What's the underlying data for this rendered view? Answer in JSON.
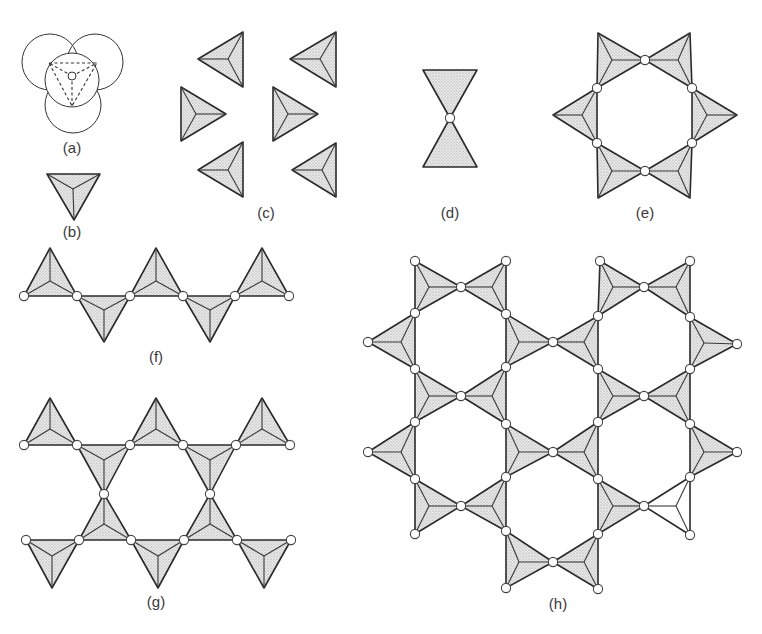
{
  "figure": {
    "colors": {
      "stipple_bg": "#e9e9e9",
      "stipple_dot": "#8a8a8a",
      "outline": "#2a2a2a",
      "oxygen_fill": "#ffffff"
    },
    "labels": [
      {
        "id": "a",
        "text": "(a)",
        "x": 72,
        "y": 153
      },
      {
        "id": "b",
        "text": "(b)",
        "x": 72,
        "y": 237
      },
      {
        "id": "c",
        "text": "(c)",
        "x": 266,
        "y": 218
      },
      {
        "id": "d",
        "text": "(d)",
        "x": 450,
        "y": 218
      },
      {
        "id": "e",
        "text": "(e)",
        "x": 645,
        "y": 218
      },
      {
        "id": "f",
        "text": "(f)",
        "x": 156,
        "y": 362
      },
      {
        "id": "g",
        "text": "(g)",
        "x": 156,
        "y": 607
      },
      {
        "id": "h",
        "text": "(h)",
        "x": 558,
        "y": 609
      }
    ],
    "panel_a": {
      "back_spheres": [
        {
          "cx": 50,
          "cy": 62,
          "r": 28
        },
        {
          "cx": 95,
          "cy": 62,
          "r": 28
        },
        {
          "cx": 73,
          "cy": 105,
          "r": 28
        }
      ],
      "front_sphere": {
        "cx": 72,
        "cy": 80,
        "r": 27
      },
      "dashed_triangle": [
        [
          49,
          63
        ],
        [
          97,
          63
        ],
        [
          72,
          106
        ]
      ],
      "dashed_center": [
        72,
        76
      ],
      "central_atom": {
        "cx": 72,
        "cy": 76,
        "r": 4
      }
    },
    "panel_d": {
      "triangles": [
        [
          [
            423,
            70
          ],
          [
            477,
            70
          ],
          [
            450,
            118
          ]
        ],
        [
          [
            450,
            118
          ],
          [
            423,
            167
          ],
          [
            477,
            167
          ]
        ]
      ],
      "oxygens": [
        [
          450,
          118
        ]
      ]
    },
    "tetrahedra": [
      {
        "panel": "b",
        "pts": [
          [
            47,
            174
          ],
          [
            100,
            174
          ],
          [
            74,
            220
          ]
        ],
        "c": [
          73,
          189
        ]
      },
      {
        "panel": "c",
        "pts": [
          [
            198,
            59
          ],
          [
            243,
            32
          ],
          [
            243,
            87
          ]
        ],
        "c": [
          228,
          59
        ]
      },
      {
        "panel": "c",
        "pts": [
          [
            290,
            59
          ],
          [
            336,
            32
          ],
          [
            336,
            87
          ]
        ],
        "c": [
          320,
          59
        ]
      },
      {
        "panel": "c",
        "pts": [
          [
            181,
            87
          ],
          [
            181,
            141
          ],
          [
            226,
            114
          ]
        ],
        "c": [
          196,
          114
        ]
      },
      {
        "panel": "c",
        "pts": [
          [
            273,
            87
          ],
          [
            273,
            141
          ],
          [
            318,
            114
          ]
        ],
        "c": [
          288,
          114
        ]
      },
      {
        "panel": "c",
        "pts": [
          [
            198,
            170
          ],
          [
            243,
            142
          ],
          [
            243,
            197
          ]
        ],
        "c": [
          228,
          170
        ]
      },
      {
        "panel": "c",
        "pts": [
          [
            292,
            170
          ],
          [
            336,
            143
          ],
          [
            336,
            197
          ]
        ],
        "c": [
          322,
          170
        ]
      },
      {
        "panel": "e",
        "pts": [
          [
            598,
            33
          ],
          [
            597,
            88
          ],
          [
            645,
            60
          ]
        ],
        "c": [
          612,
          60
        ]
      },
      {
        "panel": "e",
        "pts": [
          [
            645,
            60
          ],
          [
            690,
            33
          ],
          [
            692,
            88
          ]
        ],
        "c": [
          678,
          60
        ]
      },
      {
        "panel": "e",
        "pts": [
          [
            597,
            88
          ],
          [
            597,
            143
          ],
          [
            553,
            115
          ]
        ],
        "c": [
          582,
          115
        ]
      },
      {
        "panel": "e",
        "pts": [
          [
            692,
            88
          ],
          [
            692,
            143
          ],
          [
            737,
            115
          ]
        ],
        "c": [
          707,
          115
        ]
      },
      {
        "panel": "e",
        "pts": [
          [
            597,
            143
          ],
          [
            598,
            198
          ],
          [
            645,
            171
          ]
        ],
        "c": [
          612,
          171
        ]
      },
      {
        "panel": "e",
        "pts": [
          [
            645,
            171
          ],
          [
            692,
            143
          ],
          [
            690,
            198
          ]
        ],
        "c": [
          678,
          171
        ]
      },
      {
        "panel": "f",
        "pts": [
          [
            24,
            296
          ],
          [
            77,
            296
          ],
          [
            50,
            248
          ]
        ],
        "c": [
          50,
          281
        ]
      },
      {
        "panel": "f",
        "pts": [
          [
            77,
            296
          ],
          [
            130,
            296
          ],
          [
            104,
            342
          ]
        ],
        "c": [
          104,
          310
        ]
      },
      {
        "panel": "f",
        "pts": [
          [
            130,
            296
          ],
          [
            183,
            296
          ],
          [
            156,
            248
          ]
        ],
        "c": [
          156,
          281
        ]
      },
      {
        "panel": "f",
        "pts": [
          [
            183,
            296
          ],
          [
            235,
            296
          ],
          [
            210,
            342
          ]
        ],
        "c": [
          210,
          310
        ]
      },
      {
        "panel": "f",
        "pts": [
          [
            235,
            296
          ],
          [
            289,
            296
          ],
          [
            262,
            248
          ]
        ],
        "c": [
          262,
          281
        ]
      },
      {
        "panel": "g",
        "pts": [
          [
            24,
            445
          ],
          [
            77,
            445
          ],
          [
            50,
            398
          ]
        ],
        "c": [
          50,
          429
        ]
      },
      {
        "panel": "g",
        "pts": [
          [
            77,
            445
          ],
          [
            130,
            445
          ],
          [
            104,
            494
          ]
        ],
        "c": [
          104,
          460
        ]
      },
      {
        "panel": "g",
        "pts": [
          [
            130,
            445
          ],
          [
            183,
            445
          ],
          [
            156,
            398
          ]
        ],
        "c": [
          156,
          429
        ]
      },
      {
        "panel": "g",
        "pts": [
          [
            183,
            445
          ],
          [
            236,
            445
          ],
          [
            210,
            494
          ]
        ],
        "c": [
          210,
          460
        ]
      },
      {
        "panel": "g",
        "pts": [
          [
            236,
            445
          ],
          [
            290,
            445
          ],
          [
            262,
            398
          ]
        ],
        "c": [
          262,
          429
        ]
      },
      {
        "panel": "g",
        "pts": [
          [
            26,
            540
          ],
          [
            79,
            540
          ],
          [
            52,
            588
          ]
        ],
        "c": [
          52,
          556
        ]
      },
      {
        "panel": "g",
        "pts": [
          [
            79,
            540
          ],
          [
            131,
            540
          ],
          [
            104,
            494
          ]
        ],
        "c": [
          104,
          524
        ]
      },
      {
        "panel": "g",
        "pts": [
          [
            131,
            540
          ],
          [
            184,
            540
          ],
          [
            158,
            588
          ]
        ],
        "c": [
          158,
          556
        ]
      },
      {
        "panel": "g",
        "pts": [
          [
            184,
            540
          ],
          [
            237,
            540
          ],
          [
            210,
            494
          ]
        ],
        "c": [
          210,
          524
        ]
      },
      {
        "panel": "g",
        "pts": [
          [
            237,
            540
          ],
          [
            291,
            540
          ],
          [
            264,
            588
          ]
        ],
        "c": [
          264,
          556
        ]
      },
      {
        "panel": "h",
        "pts": [
          [
            415,
            261
          ],
          [
            415,
            313
          ],
          [
            461,
            287
          ]
        ],
        "c": [
          429,
          287
        ]
      },
      {
        "panel": "h",
        "pts": [
          [
            461,
            287
          ],
          [
            506,
            261
          ],
          [
            506,
            314
          ]
        ],
        "c": [
          492,
          287
        ]
      },
      {
        "panel": "h",
        "pts": [
          [
            415,
            313
          ],
          [
            415,
            369
          ],
          [
            368,
            342
          ]
        ],
        "c": [
          401,
          342
        ]
      },
      {
        "panel": "h",
        "pts": [
          [
            506,
            314
          ],
          [
            506,
            367
          ],
          [
            553,
            342
          ]
        ],
        "c": [
          519,
          342
        ]
      },
      {
        "panel": "h",
        "pts": [
          [
            415,
            369
          ],
          [
            415,
            422
          ],
          [
            461,
            396
          ]
        ],
        "c": [
          429,
          396
        ]
      },
      {
        "panel": "h",
        "pts": [
          [
            461,
            396
          ],
          [
            506,
            367
          ],
          [
            506,
            424
          ]
        ],
        "c": [
          492,
          396
        ]
      },
      {
        "panel": "h",
        "pts": [
          [
            600,
            261
          ],
          [
            598,
            316
          ],
          [
            644,
            287
          ]
        ],
        "c": [
          613,
          287
        ]
      },
      {
        "panel": "h",
        "pts": [
          [
            644,
            287
          ],
          [
            690,
            261
          ],
          [
            690,
            317
          ]
        ],
        "c": [
          676,
          287
        ]
      },
      {
        "panel": "h",
        "pts": [
          [
            553,
            342
          ],
          [
            598,
            316
          ],
          [
            598,
            369
          ]
        ],
        "c": [
          584,
          342
        ]
      },
      {
        "panel": "h",
        "pts": [
          [
            690,
            317
          ],
          [
            690,
            369
          ],
          [
            737,
            344
          ]
        ],
        "c": [
          704,
          343
        ]
      },
      {
        "panel": "h",
        "pts": [
          [
            598,
            369
          ],
          [
            598,
            422
          ],
          [
            644,
            396
          ]
        ],
        "c": [
          613,
          396
        ]
      },
      {
        "panel": "h",
        "pts": [
          [
            644,
            396
          ],
          [
            690,
            369
          ],
          [
            690,
            424
          ]
        ],
        "c": [
          676,
          396
        ]
      },
      {
        "panel": "h",
        "pts": [
          [
            415,
            422
          ],
          [
            415,
            479
          ],
          [
            368,
            452
          ]
        ],
        "c": [
          401,
          452
        ]
      },
      {
        "panel": "h",
        "pts": [
          [
            506,
            424
          ],
          [
            506,
            477
          ],
          [
            553,
            452
          ]
        ],
        "c": [
          519,
          452
        ]
      },
      {
        "panel": "h",
        "pts": [
          [
            415,
            479
          ],
          [
            415,
            534
          ],
          [
            461,
            506
          ]
        ],
        "c": [
          429,
          506
        ]
      },
      {
        "panel": "h",
        "pts": [
          [
            461,
            506
          ],
          [
            506,
            477
          ],
          [
            506,
            531
          ]
        ],
        "c": [
          492,
          506
        ]
      },
      {
        "panel": "h",
        "pts": [
          [
            553,
            452
          ],
          [
            598,
            422
          ],
          [
            598,
            479
          ]
        ],
        "c": [
          584,
          452
        ]
      },
      {
        "panel": "h",
        "pts": [
          [
            690,
            424
          ],
          [
            690,
            477
          ],
          [
            737,
            452
          ]
        ],
        "c": [
          704,
          452
        ]
      },
      {
        "panel": "h",
        "pts": [
          [
            598,
            479
          ],
          [
            598,
            534
          ],
          [
            644,
            506
          ]
        ],
        "c": [
          613,
          506
        ]
      },
      {
        "panel": "h",
        "pts": [
          [
            644,
            506
          ],
          [
            690,
            477
          ],
          [
            690,
            535
          ]
        ],
        "c": [
          676,
          506
        ],
        "unshaded": true
      },
      {
        "panel": "h",
        "pts": [
          [
            506,
            531
          ],
          [
            506,
            588
          ],
          [
            553,
            562
          ]
        ],
        "c": [
          519,
          562
        ]
      },
      {
        "panel": "h",
        "pts": [
          [
            553,
            562
          ],
          [
            598,
            534
          ],
          [
            598,
            589
          ]
        ],
        "c": [
          584,
          562
        ]
      }
    ],
    "oxygens": [
      [
        645,
        60
      ],
      [
        597,
        88
      ],
      [
        692,
        88
      ],
      [
        597,
        143
      ],
      [
        692,
        143
      ],
      [
        645,
        171
      ],
      [
        24,
        296
      ],
      [
        77,
        296
      ],
      [
        130,
        296
      ],
      [
        183,
        296
      ],
      [
        235,
        296
      ],
      [
        289,
        296
      ],
      [
        24,
        445
      ],
      [
        77,
        445
      ],
      [
        130,
        445
      ],
      [
        183,
        445
      ],
      [
        236,
        445
      ],
      [
        290,
        445
      ],
      [
        104,
        494
      ],
      [
        210,
        494
      ],
      [
        26,
        540
      ],
      [
        79,
        540
      ],
      [
        131,
        540
      ],
      [
        184,
        540
      ],
      [
        237,
        540
      ],
      [
        291,
        540
      ],
      [
        415,
        261
      ],
      [
        506,
        261
      ],
      [
        600,
        261
      ],
      [
        690,
        261
      ],
      [
        461,
        287
      ],
      [
        644,
        287
      ],
      [
        415,
        313
      ],
      [
        506,
        314
      ],
      [
        598,
        316
      ],
      [
        690,
        317
      ],
      [
        368,
        342
      ],
      [
        553,
        342
      ],
      [
        737,
        344
      ],
      [
        415,
        369
      ],
      [
        506,
        367
      ],
      [
        598,
        369
      ],
      [
        690,
        369
      ],
      [
        461,
        396
      ],
      [
        644,
        396
      ],
      [
        415,
        422
      ],
      [
        506,
        424
      ],
      [
        598,
        422
      ],
      [
        690,
        424
      ],
      [
        368,
        452
      ],
      [
        553,
        452
      ],
      [
        737,
        452
      ],
      [
        415,
        479
      ],
      [
        506,
        477
      ],
      [
        598,
        479
      ],
      [
        690,
        477
      ],
      [
        461,
        506
      ],
      [
        644,
        506
      ],
      [
        415,
        534
      ],
      [
        506,
        531
      ],
      [
        598,
        534
      ],
      [
        690,
        535
      ],
      [
        553,
        562
      ],
      [
        506,
        588
      ],
      [
        598,
        589
      ]
    ]
  }
}
